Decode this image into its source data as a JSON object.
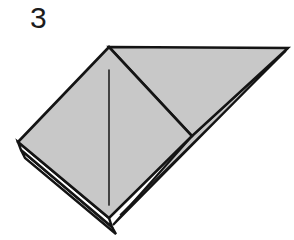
{
  "figure": {
    "kind": "origami-fold-diagram",
    "step_label": "3",
    "background_color": "#ffffff"
  },
  "palette": {
    "paper_front": "#c8c8c8",
    "paper_front_alt": "#c3c3c3",
    "paper_back": "#ffffff",
    "outline": "#141414",
    "crease_line": "#2b2b2b",
    "label_color": "#1c1c1c"
  },
  "geometry": {
    "apex": [
      109,
      47
    ],
    "right_tip": [
      288,
      48
    ],
    "left_corner": [
      18,
      142
    ],
    "bottom_vertex": [
      109,
      218
    ],
    "inner_square_right_vertex": [
      192,
      136
    ],
    "crease_line_start": [
      109,
      70
    ],
    "crease_line_end": [
      109,
      205
    ],
    "layer_tips": [
      [
        109,
        218
      ],
      [
        112,
        226
      ],
      [
        115,
        233
      ]
    ]
  },
  "shapes": {
    "left_panel": {
      "name": "left-square-panel",
      "points": "109,47 192,136 109,218 18,142",
      "fill": "#c8c8c8"
    },
    "right_triangle": {
      "name": "right-triangle-flap",
      "points": "109,47 288,48 192,136",
      "fill": "#c8c8c8"
    },
    "lower_right_triangle": {
      "name": "lower-right-triangle-flap",
      "points": "192,136 288,48 113,225",
      "fill": "#c8c8c8"
    },
    "under_layer_one": {
      "name": "under-layer-one",
      "points": "18,142 109,218 112,227 21,150",
      "fill": "#ffffff"
    },
    "under_layer_two": {
      "name": "under-layer-two",
      "points": "21,150 112,227 116,234 25,158",
      "fill": "#ffffff"
    }
  },
  "annotations": {
    "crease_label": "valley-fold-crease",
    "edges_label": "stacked-paper-edges"
  }
}
